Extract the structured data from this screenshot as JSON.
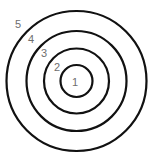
{
  "diagram": {
    "type": "concentric-circles-target",
    "center": {
      "x": 76.5,
      "y": 81
    },
    "stroke_color": "#111111",
    "label_color": "#6e6e6e",
    "rings": [
      {
        "id": "ring-1",
        "r": 16
      },
      {
        "id": "ring-2",
        "r": 32.5
      },
      {
        "id": "ring-3",
        "r": 50
      },
      {
        "id": "ring-4",
        "r": 70
      }
    ],
    "labels": [
      {
        "text": "1",
        "x": 72,
        "y": 86
      },
      {
        "text": "2",
        "x": 54,
        "y": 71
      },
      {
        "text": "3",
        "x": 41,
        "y": 57
      },
      {
        "text": "4",
        "x": 28,
        "y": 43
      },
      {
        "text": "5",
        "x": 15,
        "y": 28
      }
    ]
  }
}
